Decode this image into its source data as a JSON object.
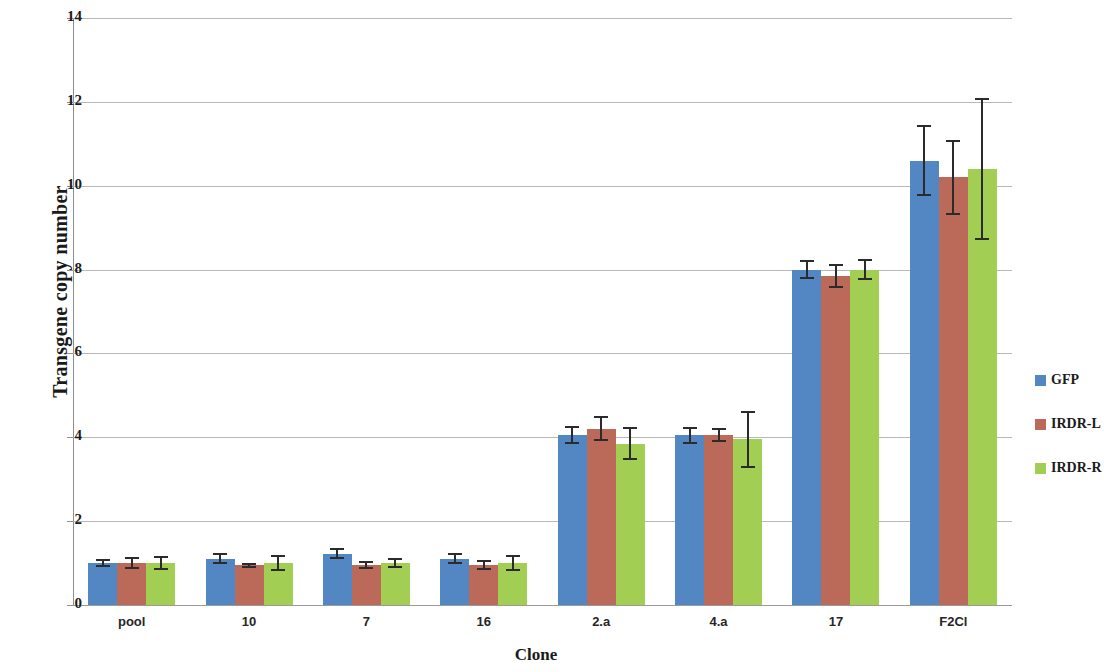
{
  "chart_data": {
    "type": "bar",
    "title": "",
    "xlabel": "Clone",
    "ylabel": "Transgene copy number",
    "ylim": [
      0,
      14
    ],
    "yticks": [
      0,
      2,
      4,
      6,
      8,
      10,
      12,
      14
    ],
    "ytick_labels": [
      "0",
      "2",
      "4",
      "6",
      "8",
      "10",
      "12",
      "14"
    ],
    "grid": true,
    "legend_position": "right",
    "categories": [
      "pool",
      "10",
      "7",
      "16",
      "2.a",
      "4.a",
      "17",
      "F2Cl"
    ],
    "series": [
      {
        "name": "GFP",
        "color": "#5387c4",
        "values": [
          1.0,
          1.1,
          1.22,
          1.1,
          4.05,
          4.05,
          8.0,
          10.6
        ],
        "errors": [
          0.1,
          0.13,
          0.13,
          0.13,
          0.22,
          0.2,
          0.22,
          0.85
        ]
      },
      {
        "name": "IRDR-L",
        "color": "#bb6a59",
        "values": [
          1.0,
          0.95,
          0.95,
          0.95,
          4.2,
          4.05,
          7.85,
          10.2
        ],
        "errors": [
          0.15,
          0.06,
          0.1,
          0.12,
          0.3,
          0.16,
          0.28,
          0.9
        ]
      },
      {
        "name": "IRDR-R",
        "color": "#a3ce54",
        "values": [
          1.0,
          1.0,
          1.0,
          1.0,
          3.85,
          3.95,
          8.0,
          10.4
        ],
        "errors": [
          0.17,
          0.2,
          0.12,
          0.2,
          0.4,
          0.68,
          0.25,
          1.7
        ]
      }
    ]
  },
  "legend": {
    "items": [
      {
        "label": "GFP",
        "color": "#5387c4"
      },
      {
        "label": "IRDR-L",
        "color": "#bb6a59"
      },
      {
        "label": "IRDR-R",
        "color": "#a3ce54"
      }
    ]
  }
}
